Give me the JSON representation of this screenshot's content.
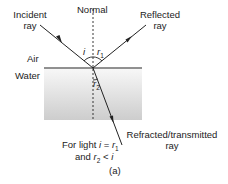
{
  "labels": {
    "normal": "Normal",
    "incident_1": "Incident",
    "incident_2": "ray",
    "reflected_1": "Reflected",
    "reflected_2": "ray",
    "medium_top": "Air",
    "medium_bottom": "Water",
    "angle_i": "i",
    "angle_r1": "r",
    "angle_r1_sub": "1",
    "angle_r2": "r",
    "angle_r2_sub": "2",
    "refracted_1": "Refracted/transmitted",
    "refracted_2": "ray",
    "note_line1_pre": "For light ",
    "note_line1_i": "i",
    "note_line1_eq": " = ",
    "note_line1_r": "r",
    "note_line1_sub": "1",
    "note_line2_pre": "and ",
    "note_line2_r": "r",
    "note_line2_sub": "2",
    "note_line2_lt": " < ",
    "note_line2_i": "i",
    "caption": "(a)"
  },
  "colors": {
    "line": "#222222",
    "water_top": "#f6f6f6",
    "water_bottom": "#cfcfcf"
  }
}
